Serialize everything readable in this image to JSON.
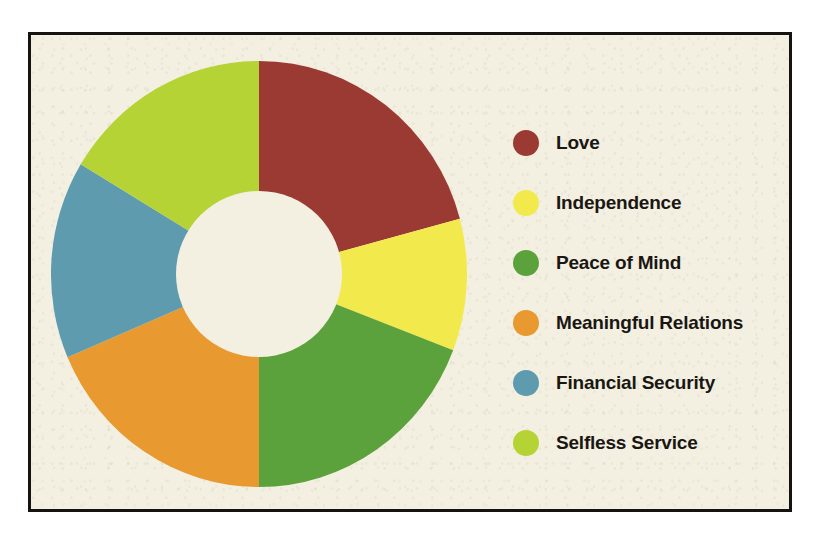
{
  "figure": {
    "background_color": "#f3f0e2",
    "border_color": "#15130f",
    "hole_color": "#f3f0e2"
  },
  "chart_data": {
    "type": "pie",
    "variant": "donut",
    "title": "",
    "subtitle": "",
    "xlabel": "",
    "ylabel": "",
    "grid": false,
    "legend_position": "right",
    "start_angle_deg": 0,
    "direction": "clockwise",
    "inner_radius_ratio": 0.39,
    "categories": [
      "Love",
      "Independence",
      "Peace of Mind",
      "Meaningful Relations",
      "Financial Security",
      "Selfless Service"
    ],
    "values": [
      75,
      36,
      69,
      67,
      54,
      59
    ],
    "percentages": [
      20.8,
      10.0,
      19.2,
      18.6,
      15.0,
      16.4
    ],
    "angles_deg": [
      75,
      36,
      69,
      67,
      54,
      59
    ],
    "colors": [
      "#9b3a32",
      "#f2ea4c",
      "#5ca23c",
      "#e8992f",
      "#5e9bae",
      "#b5d334"
    ],
    "slices": [
      {
        "label": "Love",
        "color": "#9b3a32",
        "start_deg": 0,
        "end_deg": 75,
        "value": 75,
        "percent": 20.8
      },
      {
        "label": "Independence",
        "color": "#f2ea4c",
        "start_deg": 75,
        "end_deg": 111,
        "value": 36,
        "percent": 10.0
      },
      {
        "label": "Peace of Mind",
        "color": "#5ca23c",
        "start_deg": 111,
        "end_deg": 180,
        "value": 69,
        "percent": 19.2
      },
      {
        "label": "Meaningful Relations",
        "color": "#e8992f",
        "start_deg": 180,
        "end_deg": 247,
        "value": 67,
        "percent": 18.6
      },
      {
        "label": "Financial Security",
        "color": "#5e9bae",
        "start_deg": 247,
        "end_deg": 301,
        "value": 54,
        "percent": 15.0
      },
      {
        "label": "Selfless Service",
        "color": "#b5d334",
        "start_deg": 301,
        "end_deg": 360,
        "value": 59,
        "percent": 16.4
      }
    ]
  },
  "legend": {
    "items": [
      {
        "label": "Love",
        "color": "#9b3a32"
      },
      {
        "label": "Independence",
        "color": "#f2ea4c"
      },
      {
        "label": "Peace of Mind",
        "color": "#5ca23c"
      },
      {
        "label": "Meaningful Relations",
        "color": "#e8992f"
      },
      {
        "label": "Financial Security",
        "color": "#5e9bae"
      },
      {
        "label": "Selfless Service",
        "color": "#b5d334"
      }
    ]
  }
}
